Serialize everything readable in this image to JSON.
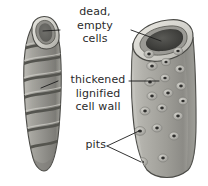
{
  "figure": {
    "background_color": "#ffffff",
    "text_color": "#2b2b2b",
    "line_color": "#1c1c1c"
  },
  "labels": {
    "dead_empty_cells": {
      "line1": "dead,",
      "line2": "empty",
      "line3": "cells"
    },
    "thickened_wall": {
      "line1": "thickened",
      "line2": "lignified",
      "line3": "cell wall"
    },
    "pits": {
      "text": "pits"
    }
  },
  "structures": {
    "left_vessel": {
      "name": "spiral-thickened-vessel",
      "fill_color": "#9a9a96",
      "band_color": "#5c5c58",
      "rim_color": "#d7d6d0",
      "band_count": 7
    },
    "right_vessel": {
      "name": "pitted-vessel",
      "fill_color": "#a8a7a1",
      "rim_color": "#dcdbd5",
      "lumen_color": "#3d3d3a",
      "pit_dot_color": "#2e2e2c",
      "pit_halo_color": "#bfbeb8",
      "pit_count": 17
    }
  },
  "pits_data": {
    "points": [
      {
        "cx": 149,
        "cy": 54,
        "r": 2.0
      },
      {
        "cx": 178,
        "cy": 51,
        "r": 1.9
      },
      {
        "cx": 152,
        "cy": 66,
        "r": 2.1
      },
      {
        "cx": 166,
        "cy": 62,
        "r": 1.8
      },
      {
        "cx": 180,
        "cy": 69,
        "r": 2.0
      },
      {
        "cx": 150,
        "cy": 82,
        "r": 2.1
      },
      {
        "cx": 165,
        "cy": 78,
        "r": 1.9
      },
      {
        "cx": 181,
        "cy": 86,
        "r": 2.0
      },
      {
        "cx": 152,
        "cy": 96,
        "r": 2.0
      },
      {
        "cx": 168,
        "cy": 93,
        "r": 2.0
      },
      {
        "cx": 183,
        "cy": 101,
        "r": 1.9
      },
      {
        "cx": 145,
        "cy": 111,
        "r": 2.0
      },
      {
        "cx": 162,
        "cy": 108,
        "r": 2.0
      },
      {
        "cx": 178,
        "cy": 116,
        "r": 2.0
      },
      {
        "cx": 140,
        "cy": 131,
        "r": 2.2
      },
      {
        "cx": 157,
        "cy": 128,
        "r": 2.0
      },
      {
        "cx": 174,
        "cy": 136,
        "r": 2.0
      },
      {
        "cx": 142,
        "cy": 162,
        "r": 2.2
      },
      {
        "cx": 163,
        "cy": 158,
        "r": 2.0
      }
    ]
  },
  "leader_lines": {
    "dead_left": "from label to left vessel lumen",
    "dead_right": "from label to right vessel lumen",
    "wall_left": "from label to left vessel wall",
    "wall_right": "from label to right vessel wall",
    "pits_upper": "from pits label to upper pit",
    "pits_lower": "from pits label to lower pit"
  }
}
